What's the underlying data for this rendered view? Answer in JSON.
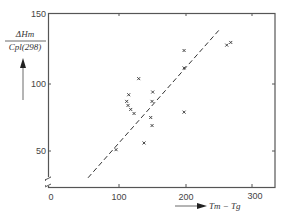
{
  "chart_data": {
    "type": "scatter",
    "title": "",
    "xlabel": "Tm − Tg",
    "ylabel_numerator": "ΔHm",
    "ylabel_denominator": "Cpl(298)",
    "xlim": [
      0,
      330
    ],
    "ylim": [
      25,
      153
    ],
    "x_ticks": [
      0,
      100,
      200,
      300
    ],
    "y_ticks": [
      50,
      100,
      150
    ],
    "grid": false,
    "legend": null,
    "marker": "x",
    "points": [
      {
        "x": 96,
        "y": 51
      },
      {
        "x": 112,
        "y": 87
      },
      {
        "x": 114,
        "y": 84
      },
      {
        "x": 115,
        "y": 92
      },
      {
        "x": 118,
        "y": 81
      },
      {
        "x": 123,
        "y": 78
      },
      {
        "x": 130,
        "y": 104
      },
      {
        "x": 138,
        "y": 56
      },
      {
        "x": 148,
        "y": 75
      },
      {
        "x": 150,
        "y": 87
      },
      {
        "x": 150,
        "y": 69
      },
      {
        "x": 151,
        "y": 94
      },
      {
        "x": 198,
        "y": 125
      },
      {
        "x": 198,
        "y": 112
      },
      {
        "x": 198,
        "y": 79
      },
      {
        "x": 262,
        "y": 129
      },
      {
        "x": 268,
        "y": 131
      }
    ],
    "fit_line": {
      "style": "dashed",
      "x": [
        54,
        250
      ],
      "y": [
        30,
        140
      ]
    },
    "annotations": [
      "y-axis break near origin"
    ]
  },
  "labels": {
    "x_axis": "Tm − Tg",
    "y_num": "ΔHm",
    "y_den": "Cpl(298)",
    "xt0": "0",
    "xt1": "100",
    "xt2": "200",
    "xt3": "300",
    "yt0": "50",
    "yt1": "100",
    "yt2": "150"
  }
}
